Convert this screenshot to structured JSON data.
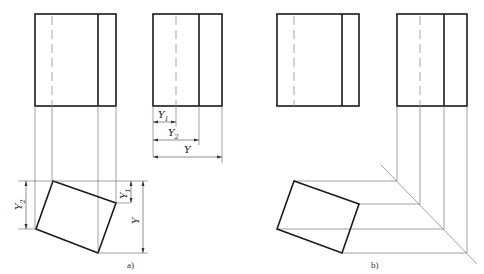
{
  "figure": {
    "panels": [
      {
        "id": "a",
        "caption": "a)",
        "front_view": {
          "x": 35,
          "y": 14,
          "w": 81,
          "h": 92,
          "inner_line_x": 98,
          "hidden_line_x": 52
        },
        "side_view": {
          "x": 153,
          "y": 14,
          "w": 69,
          "h": 92,
          "inner_line_x": 199,
          "hidden_line_x": 176
        },
        "rotated_view": {
          "points": [
            [
              53,
              181
            ],
            [
              116,
              203
            ],
            [
              98,
              253
            ],
            [
              36,
              229
            ]
          ]
        },
        "dimensions": {
          "y1": {
            "label": "Y",
            "sub": "1"
          },
          "y2": {
            "label": "Y",
            "sub": "2"
          },
          "y": {
            "label": "Y",
            "sub": ""
          }
        }
      },
      {
        "id": "b",
        "caption": "b)",
        "front_view": {
          "x": 277,
          "y": 14,
          "w": 82,
          "h": 92,
          "inner_line_x": 342,
          "hidden_line_x": 294
        },
        "side_view": {
          "x": 397,
          "y": 14,
          "w": 70,
          "h": 92,
          "inner_line_x": 444,
          "hidden_line_x": 420
        },
        "rotated_view": {
          "points": [
            [
              294,
              181
            ],
            [
              359,
              204
            ],
            [
              342,
              253
            ],
            [
              277,
              229
            ]
          ]
        }
      }
    ]
  },
  "labels": {
    "a_caption": "a)",
    "b_caption": "b)",
    "Y": "Y",
    "sub1": "1",
    "sub2": "2"
  }
}
